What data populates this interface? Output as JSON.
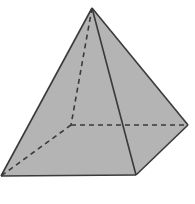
{
  "diagram": {
    "type": "square-pyramid",
    "fill_color": "#b4b4b4",
    "stroke_color": "#3a3a3a",
    "vertices": {
      "apex": [
        92,
        8
      ],
      "front_left": [
        1,
        176
      ],
      "front_right": [
        136,
        175
      ],
      "back_right": [
        188,
        125
      ],
      "back_left_hidden": [
        71,
        125
      ]
    },
    "visible_edges": [
      [
        "apex",
        "front_left"
      ],
      [
        "apex",
        "front_right"
      ],
      [
        "apex",
        "back_right"
      ],
      [
        "front_left",
        "front_right"
      ],
      [
        "front_right",
        "back_right"
      ]
    ],
    "hidden_edges": [
      [
        "apex",
        "back_left_hidden"
      ],
      [
        "back_left_hidden",
        "front_left"
      ],
      [
        "back_left_hidden",
        "back_right"
      ]
    ]
  }
}
